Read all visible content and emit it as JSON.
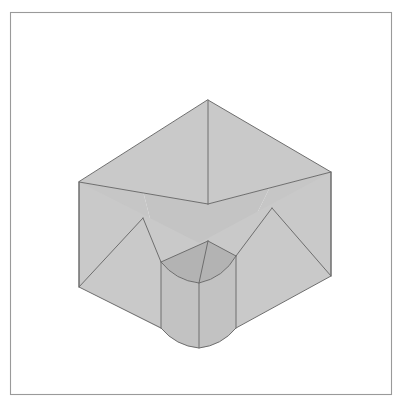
{
  "document": {
    "title": "Isometric Solid Figure",
    "background_color": "#ffffff"
  },
  "frame": {
    "name": "page-border",
    "x": 10,
    "y": 12,
    "width": 381,
    "height": 382,
    "stroke_color": "#9a9a9a",
    "stroke_width": 1.1,
    "fill": "none"
  },
  "figure": {
    "projection": "isometric",
    "line_color": "#6e6e6e",
    "line_width": 1.0,
    "colors": {
      "top_left_face": "#c9c9c9",
      "top_right_face": "#c9c9c9",
      "interior_floor_left": "#c4c4c4",
      "interior_floor_right": "#c4c4c4",
      "interior_wall_left": "#c6c6c6",
      "interior_wall_right": "#c6c6c6",
      "front_left_face": "#c9c9c9",
      "front_right_face": "#c9c9c9",
      "notch_top_surface": "#b3b3b3",
      "notch_inner_left": "#c2c2c2",
      "notch_inner_right": "#c2c2c2"
    },
    "vertices": {
      "top_apex": [
        208,
        100
      ],
      "top_left_corner": [
        79,
        182
      ],
      "top_right_corner": [
        331,
        172
      ],
      "interior_center": [
        208,
        204
      ],
      "bottom_left_corner": [
        79,
        287
      ],
      "bottom_right_corner": [
        331,
        276
      ],
      "notch_left_top": [
        161,
        262
      ],
      "notch_right_top": [
        236,
        256
      ],
      "notch_center_bottom": [
        199,
        283
      ],
      "notch_left_bottom": [
        161,
        328
      ],
      "notch_right_bottom": [
        236,
        328
      ],
      "notch_arc_low": [
        199,
        348
      ]
    },
    "geometry_notes": {
      "cut_corner_depth_px": 104,
      "notch_width_px": 75,
      "notch_height_px": 66
    }
  }
}
